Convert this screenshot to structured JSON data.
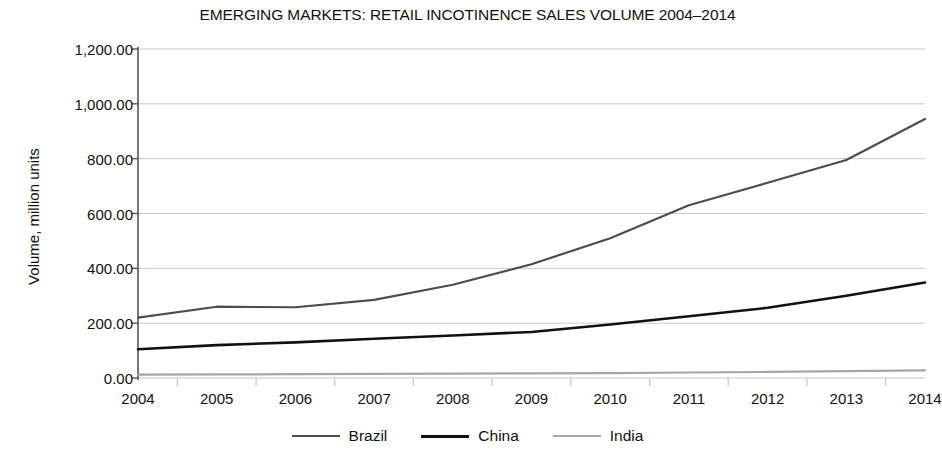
{
  "chart_data": {
    "type": "line",
    "title": "EMERGING MARKETS: RETAIL INCOTINENCE SALES VOLUME 2004–2014",
    "xlabel": "",
    "ylabel": "Volume, million units",
    "categories": [
      "2004",
      "2005",
      "2006",
      "2007",
      "2008",
      "2009",
      "2010",
      "2011",
      "2012",
      "2013",
      "2014"
    ],
    "x": [
      2004,
      2005,
      2006,
      2007,
      2008,
      2009,
      2010,
      2011,
      2012,
      2013,
      2014
    ],
    "ylim": [
      0,
      1200
    ],
    "ytick_values": [
      0,
      200,
      400,
      600,
      800,
      1000,
      1200
    ],
    "ytick_labels": [
      "0.00",
      "200.00",
      "400.00",
      "600.00",
      "800.00",
      "1,000.00",
      "1,200.00"
    ],
    "grid": "horizontal",
    "legend_position": "bottom",
    "series": [
      {
        "name": "Brazil",
        "color": "#4d4d4d",
        "width": 2.2,
        "values": [
          220,
          260,
          258,
          285,
          340,
          415,
          510,
          630,
          712,
          795,
          945
        ]
      },
      {
        "name": "China",
        "color": "#111111",
        "width": 2.6,
        "values": [
          105,
          120,
          130,
          143,
          155,
          168,
          195,
          225,
          256,
          300,
          348
        ]
      },
      {
        "name": "India",
        "color": "#a6a6a6",
        "width": 2.2,
        "values": [
          12,
          13,
          14,
          15,
          16,
          17,
          18,
          20,
          22,
          25,
          28
        ]
      }
    ]
  },
  "axes": {
    "axis_line_color": "#555555",
    "grid_color": "#c8c8c8"
  }
}
